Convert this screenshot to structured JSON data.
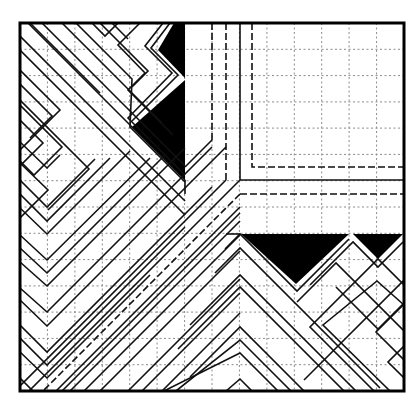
{
  "diagram": {
    "type": "crease-pattern",
    "grid": {
      "columns": 14,
      "rows": 14,
      "style": "dotted"
    },
    "colors": {
      "line": "#111111",
      "fill": "#000000",
      "grid": "#8a8a8a",
      "background": "#ffffff"
    },
    "frame": {
      "x": 20,
      "y": 23,
      "width": 384,
      "height": 368
    },
    "black_regions": [
      {
        "name": "top-notch",
        "points": "174,23 185,23 185,78 158,50"
      },
      {
        "name": "left-triangle",
        "points": "185,80 185,180 132,127"
      },
      {
        "name": "bottom-big-triangle",
        "points": "241,234 349,234 296,284"
      },
      {
        "name": "bottom-small-triangle",
        "points": "353,234 403,234 378,259"
      }
    ]
  }
}
